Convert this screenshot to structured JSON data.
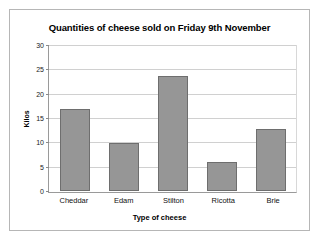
{
  "chart_data": {
    "type": "bar",
    "title": "Quantities of cheese sold on Friday 9th November",
    "xlabel": "Type of cheese",
    "ylabel": "Kilos",
    "categories": [
      "Cheddar",
      "Edam",
      "Stilton",
      "Ricotta",
      "Brie"
    ],
    "values": [
      17,
      10,
      24,
      6,
      13
    ],
    "ylim": [
      0,
      30
    ],
    "ytick_step": 5,
    "yticks": [
      0,
      5,
      10,
      15,
      20,
      25,
      30
    ],
    "ytick_labels": [
      "0",
      "5",
      "10",
      "15",
      "20",
      "25",
      "30"
    ],
    "grid": true,
    "legend": false,
    "legend_position": "none",
    "series": [
      {
        "name": "Kilos",
        "values": [
          17,
          10,
          24,
          6,
          13
        ]
      }
    ],
    "colors": {
      "bar_fill": "#969696",
      "bar_border": "#6e6e6e",
      "gridline": "#d0d0d0",
      "axis": "#9a9a9a",
      "text": "#000000",
      "background": "#ffffff",
      "frame_border": "#b6b6b6"
    }
  }
}
